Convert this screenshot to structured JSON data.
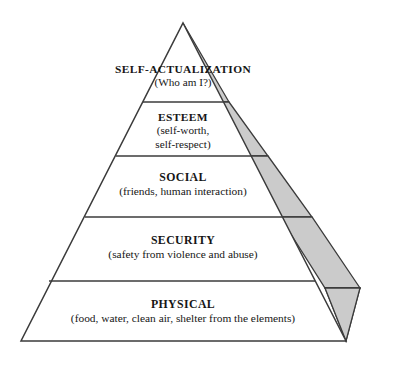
{
  "diagram": {
    "type": "pyramid",
    "name": "Maslow's Hierarchy of Needs pyramid",
    "levels": [
      {
        "rank": 5,
        "title": "SELF-ACTUALIZATION",
        "subtitle": "(Who am I?)",
        "subtitle_lines": [
          "(Who am I?)"
        ]
      },
      {
        "rank": 4,
        "title": "ESTEEM",
        "subtitle": "(self-worth, self-respect)",
        "subtitle_lines": [
          "(self-worth,",
          "self-respect)"
        ]
      },
      {
        "rank": 3,
        "title": "SOCIAL",
        "subtitle": "(friends, human interaction)",
        "subtitle_lines": [
          "(friends, human interaction)"
        ]
      },
      {
        "rank": 2,
        "title": "SECURITY",
        "subtitle": "(safety from violence and abuse)",
        "subtitle_lines": [
          "(safety from violence and abuse)"
        ]
      },
      {
        "rank": 1,
        "title": "PHYSICAL",
        "subtitle": "(food, water, clean air, shelter from the elements)",
        "subtitle_lines": [
          "(food, water, clean air, shelter from the elements)"
        ]
      }
    ],
    "colors": {
      "background": "#ffffff",
      "face_fill": "#ffffff",
      "side_fill": "#cbcbcb",
      "outline": "#3b3b3b",
      "text": "#161616"
    }
  }
}
